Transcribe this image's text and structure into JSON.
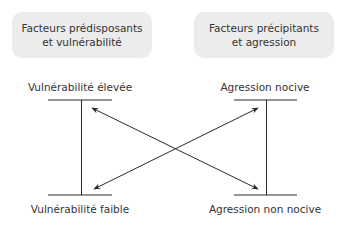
{
  "boxes": {
    "left": {
      "line1": "Facteurs prédisposants",
      "line2": "et vulnérabilité"
    },
    "right": {
      "line1": "Facteurs précipitants",
      "line2": "et agression"
    }
  },
  "scales": {
    "left": {
      "top": "Vulnérabilité élevée",
      "bottom": "Vulnérabilité faible"
    },
    "right": {
      "top": "Agression nocive",
      "bottom": "Agression non nocive"
    }
  },
  "colors": {
    "box_fill": "#ececec",
    "line": "#2a2a2a"
  }
}
